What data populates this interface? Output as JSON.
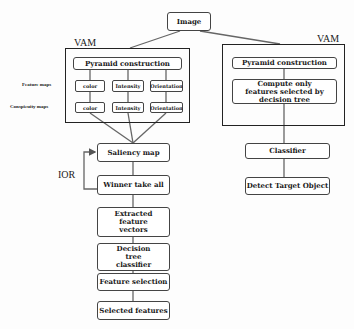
{
  "diagram": {
    "root": {
      "label": "Image"
    },
    "left_module": {
      "title": "VAM",
      "pyramid": "Pyramid construction",
      "row_labels": {
        "feature_maps": "Feature maps",
        "conspicuity_maps": "Conspicuity maps"
      },
      "feature_maps": [
        "color",
        "Intensity",
        "Orientation"
      ],
      "conspicuity_maps": [
        "color",
        "Intensity",
        "Orientation"
      ]
    },
    "left_flow": [
      "Saliency map",
      "Winner take all",
      "Extracted feature vectors",
      "Decision tree classifier",
      "Feature selection",
      "Selected features"
    ],
    "feedback_label": "IOR",
    "right_module": {
      "title": "VAM",
      "pyramid": "Pyramid construction",
      "compute": "Compute only features selected by decision tree"
    },
    "right_flow": [
      "Classifier",
      "Detect Target Object"
    ]
  }
}
